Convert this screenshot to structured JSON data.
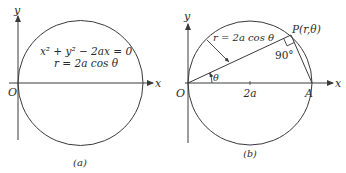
{
  "figure": {
    "stroke_color": "#3a3a3a",
    "background": "#ffffff",
    "panel_a": {
      "caption": "(a)",
      "axis_x_label": "x",
      "axis_y_label": "y",
      "origin_label": "O",
      "equation_cartesian": "x² + y² − 2ax = 0",
      "equation_polar": "r = 2a cos θ"
    },
    "panel_b": {
      "caption": "(b)",
      "axis_x_label": "x",
      "axis_y_label": "y",
      "origin_label": "O",
      "point_p_label": "P(r,θ)",
      "point_a_label": "A",
      "diameter_label": "2a",
      "angle_label": "θ",
      "right_angle_label": "90°",
      "radius_label": "r = 2a cos θ"
    }
  }
}
